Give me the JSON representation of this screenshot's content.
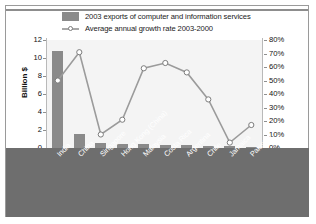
{
  "legend": {
    "bar_label": "2003 exports of computer and information services",
    "line_label": "Average annual growth rate 2003-2000",
    "bar_swatch_color": "#8a8a8a",
    "line_marker_color": "#ffffff"
  },
  "axes": {
    "left_title": "Billion $",
    "left_ticks": [
      "12",
      "10",
      "8",
      "6",
      "4",
      "2",
      "0"
    ],
    "right_ticks": [
      "80%",
      "70%",
      "60%",
      "50%",
      "40%",
      "30%",
      "20%",
      "10%",
      "0%"
    ]
  },
  "chart_data": {
    "type": "bar",
    "title": "",
    "xlabel": "",
    "ylabel": "Billion $",
    "y2label": "",
    "ylim": [
      0,
      12
    ],
    "y2lim": [
      0,
      80
    ],
    "grid": false,
    "legend_position": "top",
    "categories": [
      "India",
      "China",
      "Singapore",
      "Hong Kong (China)",
      "Malaysia",
      "Costa Rica",
      "Argentina",
      "Chile",
      "Jamaica",
      "Pakistan"
    ],
    "series": [
      {
        "name": "2003 exports of computer and information services",
        "type": "bar",
        "axis": "left",
        "unit": "Billion $",
        "values": [
          10.8,
          1.6,
          0.6,
          0.5,
          0.4,
          0.3,
          0.3,
          0.25,
          0.2,
          0.15
        ]
      },
      {
        "name": "Average annual growth rate 2003-2000",
        "type": "line",
        "axis": "right",
        "unit": "%",
        "values": [
          50,
          71,
          10,
          21,
          59,
          63,
          56,
          36,
          4,
          17
        ]
      }
    ]
  }
}
